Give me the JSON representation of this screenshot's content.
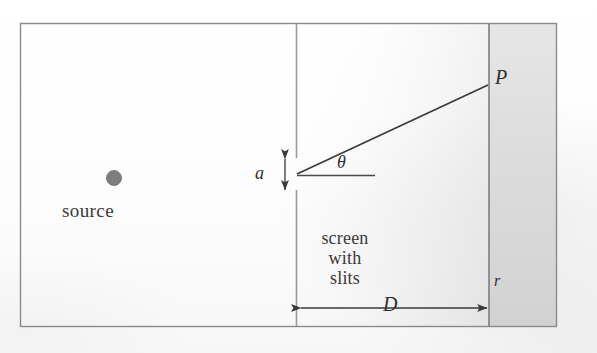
{
  "figure": {
    "kind": "physics-diagram",
    "background_color": "#ffffff",
    "ink_color": "#2f2f2f",
    "border": {
      "x": 20,
      "y": 23,
      "width": 537,
      "height": 304,
      "stroke": "#8a8a8a",
      "stroke_width": 1.4
    },
    "shading": {
      "description": "soft gray tone increasing toward the right and lower-right of the scan",
      "strip_color": "#d9d9d9"
    }
  },
  "elements": {
    "source_dot": {
      "name": "source",
      "cx": 114,
      "cy": 178,
      "r": 7.5,
      "fill": "#7d7d7d",
      "stroke": "#6a6a6a"
    },
    "source_label": "source",
    "slit_screen": {
      "name": "screen with slits",
      "x": 296,
      "y_top": 23,
      "y_bottom": 327,
      "gap_top": 158,
      "gap_bottom": 190,
      "stroke": "#9a9a9a"
    },
    "screen_label_lines": [
      "screen",
      "with",
      "slits"
    ],
    "slit_width_label": "a",
    "slit_width_arrow": {
      "x": 285,
      "y_top": 157,
      "y_bottom": 192
    },
    "ray": {
      "from_x": 297,
      "from_y": 174,
      "to_x": 488,
      "to_y": 85,
      "stroke": "#3a3a3a"
    },
    "axis_line": {
      "from_x": 297,
      "from_y": 175,
      "to_x": 375,
      "to_y": 175,
      "stroke": "#4a4a4a"
    },
    "angle_label": "θ",
    "point_label": "P",
    "observation_screen": {
      "name": "observation screen",
      "x": 489,
      "y_top": 23,
      "y_bottom": 327,
      "stroke": "#7d7d7d"
    },
    "distance_label": "D",
    "distance_arrow": {
      "from_x": 300,
      "to_x": 487,
      "y": 308
    },
    "radius_label": "r"
  }
}
